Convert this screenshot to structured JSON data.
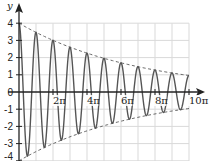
{
  "chart_data": {
    "type": "line",
    "title": "",
    "xlabel": "x",
    "ylabel": "y",
    "xlim_pi": [
      0,
      10
    ],
    "ylim": [
      -4,
      4
    ],
    "grid": true,
    "x_ticks": [
      "2π",
      "4π",
      "6π",
      "8π",
      "10π"
    ],
    "x_tick_values_pi": [
      2,
      4,
      6,
      8,
      10
    ],
    "y_ticks": [
      "4",
      "3",
      "2",
      "1",
      "0",
      "-1",
      "-2",
      "-3",
      "-4"
    ],
    "y_tick_values": [
      4,
      3,
      2,
      1,
      0,
      -1,
      -2,
      -3,
      -4
    ],
    "series": [
      {
        "name": "damped oscillation",
        "style": "solid",
        "color": "#555555",
        "function": "y = 4·e^(-x/(7π))·cos(2x)",
        "amplitude": 4,
        "decay_pi": 7,
        "frequency": 2,
        "x_pi": [
          0,
          0.5,
          1,
          1.5,
          2,
          2.5,
          3,
          3.5,
          4,
          4.5,
          5,
          5.5,
          6,
          6.5,
          7,
          7.5,
          8,
          8.5,
          9,
          9.5,
          10
        ],
        "values": [
          4.0,
          -3.72,
          3.47,
          -3.23,
          3.01,
          -2.8,
          2.61,
          -2.43,
          2.26,
          -2.1,
          1.96,
          -1.82,
          1.7,
          -1.58,
          1.47,
          -1.37,
          1.28,
          -1.19,
          1.11,
          -1.03,
          0.96
        ]
      },
      {
        "name": "upper envelope",
        "style": "dashed",
        "color": "#666666",
        "function": "y = 4·e^(-x/(7π))",
        "x_pi": [
          0,
          2,
          4,
          6,
          8,
          10
        ],
        "values": [
          4.0,
          3.01,
          2.26,
          1.7,
          1.28,
          0.96
        ]
      },
      {
        "name": "lower envelope",
        "style": "dashed",
        "color": "#666666",
        "function": "y = -4·e^(-x/(7π))",
        "x_pi": [
          0,
          2,
          4,
          6,
          8,
          10
        ],
        "values": [
          -4.0,
          -3.01,
          -2.26,
          -1.7,
          -1.28,
          -0.96
        ]
      }
    ],
    "colors": {
      "grid": "#d9d9d9",
      "axis": "#222222",
      "curve": "#555555",
      "envelope": "#666666"
    }
  }
}
